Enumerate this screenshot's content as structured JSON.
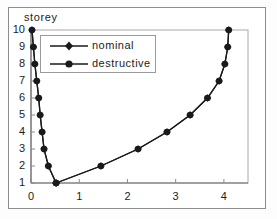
{
  "chart_data": {
    "type": "line",
    "title": "",
    "subtitle": "",
    "xlabel": "",
    "ylabel": "storey",
    "xlim": [
      0,
      4.5
    ],
    "ylim": [
      1,
      10
    ],
    "grid": false,
    "legend_position": "top-left",
    "xticks": [
      0,
      1,
      2,
      3,
      4
    ],
    "xtick_labels": [
      "0",
      "1",
      "2",
      "3",
      "4"
    ],
    "yticks": [
      1,
      2,
      3,
      4,
      5,
      6,
      7,
      8,
      9,
      10
    ],
    "ytick_labels": [
      "1",
      "2",
      "3",
      "4",
      "5",
      "6",
      "7",
      "8",
      "9",
      "10"
    ],
    "y_values": [
      1,
      2,
      3,
      4,
      5,
      6,
      7,
      8,
      9,
      10
    ],
    "series": [
      {
        "name": "nominal",
        "marker": "diamond",
        "color": "#1a1a1a",
        "branch_left": [
          0.52,
          0.36,
          0.27,
          0.23,
          0.19,
          0.16,
          0.12,
          0.08,
          0.05,
          0.02
        ],
        "branch_right": [
          0.52,
          1.45,
          2.22,
          2.82,
          3.3,
          3.66,
          3.9,
          4.02,
          4.08,
          4.1
        ]
      },
      {
        "name": "destructive",
        "marker": "circle",
        "color": "#1a1a1a",
        "branch_left": [
          0.52,
          0.36,
          0.27,
          0.23,
          0.19,
          0.16,
          0.12,
          0.08,
          0.05,
          0.02
        ],
        "branch_right": [
          0.52,
          1.45,
          2.22,
          2.82,
          3.3,
          3.66,
          3.9,
          4.02,
          4.08,
          4.1
        ]
      }
    ]
  },
  "legend": {
    "entries": [
      {
        "label": "nominal",
        "marker": "diamond"
      },
      {
        "label": "destructive",
        "marker": "circle"
      }
    ]
  },
  "axes": {
    "ylabel": "storey"
  }
}
